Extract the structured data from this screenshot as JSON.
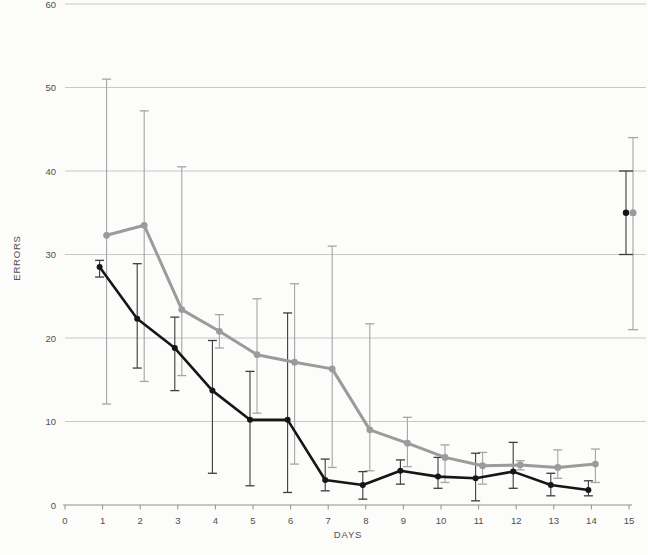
{
  "colors": {
    "background": "#fcfcfb",
    "gridline": "#c2c2c2",
    "axis": "#8f8f8f",
    "tick_label": "#4f4f4f"
  },
  "chart_data": {
    "type": "line",
    "title": "",
    "xlabel": "DAYS",
    "ylabel": "ERRORS",
    "xlim": [
      0,
      15
    ],
    "ylim": [
      0,
      60
    ],
    "xticks": [
      0,
      1,
      2,
      3,
      4,
      5,
      6,
      7,
      8,
      9,
      10,
      11,
      12,
      13,
      14,
      15
    ],
    "yticks": [
      0,
      10,
      20,
      30,
      40,
      50,
      60
    ],
    "grid": "horizontal-only",
    "legend": "none",
    "error_bars": true,
    "x_days": [
      1,
      2,
      3,
      4,
      5,
      6,
      7,
      8,
      9,
      10,
      11,
      12,
      13,
      14
    ],
    "series": [
      {
        "name": "gray-group",
        "color": "#9b9b9b",
        "errorbar_color": "#a5a5a5",
        "marker": "filled-circle",
        "line_width": 3,
        "values": [
          32.3,
          33.5,
          23.4,
          20.8,
          18.0,
          17.1,
          16.3,
          9.0,
          7.4,
          5.7,
          4.7,
          4.8,
          4.5,
          4.9
        ],
        "err_low": [
          12.1,
          14.8,
          15.5,
          18.8,
          11.0,
          4.9,
          4.5,
          4.1,
          4.6,
          2.7,
          2.5,
          4.2,
          3.2,
          2.7
        ],
        "err_high": [
          51.0,
          47.2,
          40.5,
          22.8,
          24.7,
          26.5,
          31.0,
          21.7,
          10.5,
          7.2,
          6.3,
          5.3,
          6.6,
          6.7
        ],
        "detached_point": {
          "x": 15,
          "value": 35,
          "err_low": 21,
          "err_high": 44,
          "cap_width": 10
        }
      },
      {
        "name": "black-group",
        "color": "#161616",
        "errorbar_color": "#3d3d3d",
        "marker": "filled-circle",
        "line_width": 2.6,
        "values": [
          28.5,
          22.3,
          18.8,
          13.7,
          10.2,
          10.2,
          3.0,
          2.4,
          4.1,
          3.4,
          3.2,
          4.0,
          2.4,
          1.8
        ],
        "err_low": [
          27.3,
          16.4,
          13.7,
          3.8,
          2.3,
          1.5,
          1.7,
          0.7,
          2.5,
          2.0,
          0.5,
          2.0,
          1.1,
          1.1
        ],
        "err_high": [
          29.3,
          28.9,
          22.5,
          19.7,
          16.0,
          23.0,
          5.5,
          4.0,
          5.4,
          5.7,
          6.2,
          7.5,
          3.8,
          2.9
        ],
        "detached_point": {
          "x": 15,
          "value": 35,
          "err_low": 30,
          "err_high": 40,
          "cap_width": 14
        }
      }
    ]
  }
}
